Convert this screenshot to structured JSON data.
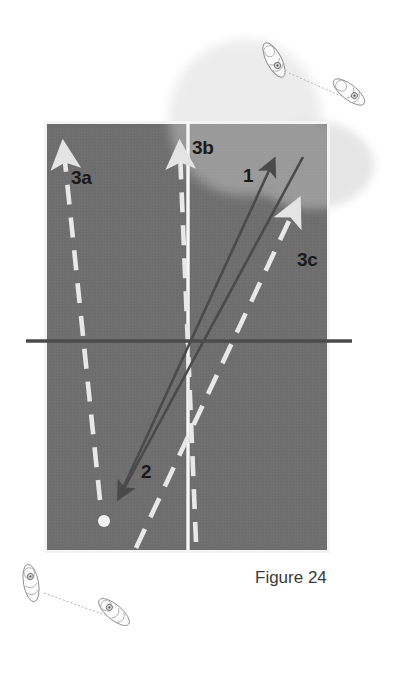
{
  "figure": {
    "caption": "Figure 24"
  },
  "court": {
    "surface_color": "#6e6e6e",
    "line_color": "#f4f4f4",
    "net_color": "#4a4a4a",
    "x": 45,
    "y": 122,
    "width": 284,
    "height": 430,
    "center_line_x": 188,
    "net_y": 341,
    "net_x_start": 26,
    "net_x_end": 352
  },
  "labels": {
    "movement_3a": "3a",
    "movement_3b": "3b",
    "movement_3c": "3c",
    "shot_1": "1",
    "shot_2": "2"
  },
  "ball": {
    "name": "tennis-ball",
    "x": 104,
    "y": 521,
    "radius": 6,
    "color": "#f2f2f2"
  },
  "shot_arrows": [
    {
      "name": "shot-arrow-1",
      "label": "1",
      "color": "#4a4a4a",
      "direction": "up-right",
      "from": [
        119,
        495
      ],
      "to": [
        275,
        158
      ]
    },
    {
      "name": "shot-arrow-2",
      "label": "2",
      "color": "#4a4a4a",
      "direction": "down-left",
      "from": [
        303,
        157
      ],
      "to": [
        118,
        500
      ]
    }
  ],
  "movement_arrows": [
    {
      "name": "movement-arrow-3a",
      "label": "3a",
      "color": "#e8e8e8",
      "style": "dashed",
      "direction": "up",
      "from": [
        100,
        500
      ],
      "to": [
        64,
        150
      ]
    },
    {
      "name": "movement-arrow-3b",
      "label": "3b",
      "color": "#e8e8e8",
      "style": "dashed",
      "direction": "up-left",
      "from": [
        196,
        540
      ],
      "to": [
        180,
        150
      ]
    },
    {
      "name": "movement-arrow-3c",
      "label": "3c",
      "color": "#e8e8e8",
      "style": "dashed",
      "direction": "up-right",
      "from": [
        138,
        545
      ],
      "to": [
        296,
        205
      ]
    }
  ],
  "bounce_zones": [
    {
      "name": "bounce-zone-top",
      "color": "#ececec",
      "cx": 245,
      "cy": 118,
      "rx": 76,
      "ry": 78
    },
    {
      "name": "bounce-zone-right",
      "color": "#e6e6e6",
      "cx": 312,
      "cy": 165,
      "rx": 62,
      "ry": 44
    }
  ],
  "footwork_pairs": [
    {
      "name": "footwork-pair-top",
      "description": "shoe sole pair connected by dotted path, upper right",
      "shoe_a": {
        "x": 274,
        "y": 60,
        "rotation": -28
      },
      "shoe_b": {
        "x": 348,
        "y": 92,
        "rotation": -52
      },
      "connector": "dotted"
    },
    {
      "name": "footwork-pair-bottom",
      "description": "shoe sole pair connected by dotted path, lower left",
      "shoe_a": {
        "x": 31,
        "y": 583,
        "rotation": -10
      },
      "shoe_b": {
        "x": 112,
        "y": 611,
        "rotation": -50
      },
      "connector": "dotted"
    }
  ]
}
